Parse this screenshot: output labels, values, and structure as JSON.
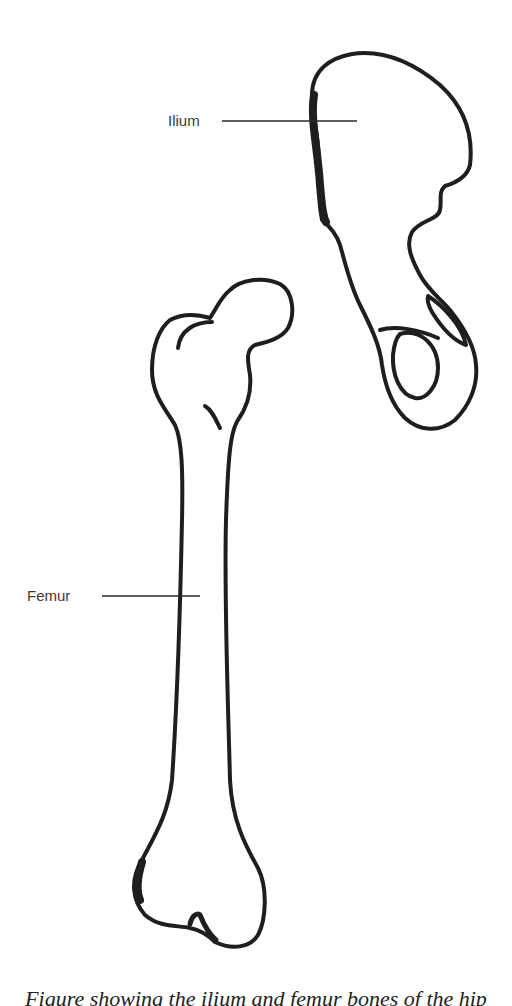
{
  "diagram": {
    "labels": {
      "ilium": "Ilium",
      "femur": "Femur"
    },
    "caption": "Figure showing the ilium and femur bones of the hip",
    "colors": {
      "outline": "#1e1e1e",
      "label_text": "#3a3a3a",
      "leader_line": "#2a2a2a",
      "background": "#ffffff"
    }
  }
}
